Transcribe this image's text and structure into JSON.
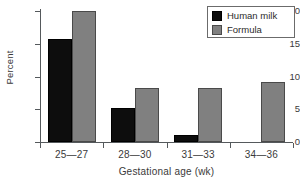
{
  "chart_data": {
    "type": "bar",
    "title": "",
    "xlabel": "Gestational age (wk)",
    "ylabel": "Percent",
    "categories": [
      "25—27",
      "28—30",
      "31—33",
      "34—36"
    ],
    "series": [
      {
        "name": "Human milk",
        "color": "#0d0d0d",
        "values": [
          15.8,
          5.2,
          1.0,
          0
        ]
      },
      {
        "name": "Formula",
        "color": "#808080",
        "values": [
          20.0,
          8.2,
          8.2,
          9.1
        ]
      }
    ],
    "ylim": [
      0,
      20
    ],
    "yticks": [
      0,
      5,
      10,
      15,
      20
    ],
    "ytick_labels": [
      "0",
      "5",
      "10",
      "15",
      "20"
    ],
    "grid": false,
    "legend_position": "top-right"
  },
  "legend": {
    "items": [
      {
        "label": "Human milk",
        "color": "#0d0d0d"
      },
      {
        "label": "Formula",
        "color": "#808080"
      }
    ]
  }
}
